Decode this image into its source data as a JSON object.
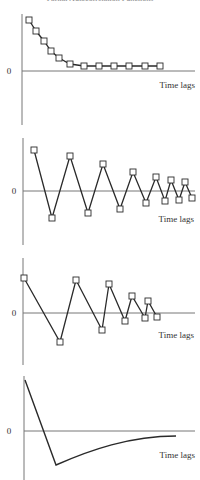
{
  "figure": {
    "title": "Partial Autocorrelation Functions",
    "zero_label": "0",
    "xlabel": "Time lags",
    "colors": {
      "line": "#2a2a2a",
      "axis": "#777777",
      "marker_fill": "#ffffff",
      "text": "#333333"
    }
  },
  "chart_data": [
    {
      "type": "line",
      "title": "",
      "xlabel": "Time lags",
      "ylabel": "",
      "ytick_labels": [
        "0"
      ],
      "markers": "square",
      "description": "Exponential decay toward zero, all positive",
      "x": [
        1,
        2,
        3,
        4,
        5,
        6,
        7,
        8,
        9,
        10,
        11,
        12
      ],
      "values": [
        1.0,
        0.79,
        0.58,
        0.42,
        0.28,
        0.15,
        0.1,
        0.1,
        0.1,
        0.1,
        0.09,
        0.09
      ],
      "ylim": [
        -1.0,
        1.1
      ],
      "grid": false,
      "px": {
        "axis_x": 22,
        "axis_y_top": 14,
        "axis_y_bottom": 125,
        "zero_y": 71,
        "x_end": 195,
        "points": [
          [
            29,
            20
          ],
          [
            36,
            31
          ],
          [
            44,
            41
          ],
          [
            51,
            51
          ],
          [
            59,
            58
          ],
          [
            70,
            64
          ],
          [
            84,
            66
          ],
          [
            99,
            66
          ],
          [
            114,
            66
          ],
          [
            129,
            66
          ],
          [
            145,
            66
          ],
          [
            160,
            66
          ]
        ],
        "zero_label_xy": [
          9,
          74
        ],
        "xlabel_xy": [
          195,
          88
        ]
      }
    },
    {
      "type": "line",
      "title": "",
      "xlabel": "Time lags",
      "ylabel": "",
      "ytick_labels": [
        "0"
      ],
      "markers": "square",
      "description": "Damped oscillation alternating sign",
      "x": [
        1,
        2,
        3,
        4,
        5,
        6,
        7,
        8,
        9,
        10,
        11,
        12,
        13,
        14
      ],
      "values": [
        0.78,
        -0.52,
        0.67,
        -0.42,
        0.52,
        -0.35,
        0.37,
        -0.19,
        0.27,
        -0.17,
        0.21,
        -0.17,
        0.16,
        -0.13
      ],
      "ylim": [
        -1.0,
        1.0
      ],
      "grid": false,
      "px": {
        "axis_x": 23,
        "axis_y_top": 138,
        "axis_y_bottom": 245,
        "zero_y": 191,
        "x_end": 195,
        "points": [
          [
            34,
            150
          ],
          [
            52,
            218
          ],
          [
            70,
            156
          ],
          [
            88,
            213
          ],
          [
            103,
            164
          ],
          [
            120,
            209
          ],
          [
            133,
            172
          ],
          [
            146,
            203
          ],
          [
            156,
            177
          ],
          [
            165,
            201
          ],
          [
            171,
            180
          ],
          [
            179,
            200
          ],
          [
            185,
            182
          ],
          [
            192,
            198
          ]
        ],
        "zero_label_xy": [
          14,
          194
        ],
        "xlabel_xy": [
          194,
          222
        ]
      }
    },
    {
      "type": "line",
      "title": "",
      "xlabel": "Time lags",
      "ylabel": "",
      "ytick_labels": [
        "0"
      ],
      "markers": "square",
      "description": "Damped oscillation with irregular spacing",
      "x": [
        1,
        2,
        3,
        4,
        5,
        6,
        7,
        8,
        9,
        10,
        11
      ],
      "values": [
        0.72,
        -0.59,
        0.69,
        -0.37,
        0.61,
        -0.16,
        0.36,
        -0.1,
        0.25,
        -0.08,
        -0.05
      ],
      "ylim": [
        -1.0,
        1.0
      ],
      "grid": false,
      "px": {
        "axis_x": 23,
        "axis_y_top": 258,
        "axis_y_bottom": 365,
        "zero_y": 313,
        "x_end": 195,
        "points": [
          [
            24,
            278
          ],
          [
            60,
            342
          ],
          [
            76,
            280
          ],
          [
            102,
            330
          ],
          [
            109,
            284
          ],
          [
            125,
            321
          ],
          [
            132,
            296
          ],
          [
            145,
            318
          ],
          [
            148,
            301
          ],
          [
            157,
            317
          ]
        ],
        "zero_label_xy": [
          14,
          316
        ],
        "xlabel_xy": [
          194,
          338
        ]
      }
    },
    {
      "type": "line",
      "title": "",
      "xlabel": "Time lags",
      "ylabel": "",
      "ytick_labels": [
        "0"
      ],
      "markers": "none",
      "description": "Sharp drop from positive to negative then smooth exponential return toward zero",
      "x": [
        0,
        1,
        2,
        3,
        4,
        5,
        6,
        7,
        8
      ],
      "values": [
        1.0,
        -0.68,
        -0.5,
        -0.36,
        -0.25,
        -0.17,
        -0.12,
        -0.09,
        -0.1
      ],
      "ylim": [
        -0.9,
        1.1
      ],
      "grid": false,
      "px": {
        "axis_x": 24,
        "axis_y_top": 376,
        "axis_y_bottom": 480,
        "zero_y": 431,
        "x_end": 195,
        "path": "M25,380 L56,465 C90,450 130,436 176,436",
        "zero_label_xy": [
          9,
          434
        ],
        "xlabel_xy": [
          195,
          458
        ]
      }
    }
  ]
}
